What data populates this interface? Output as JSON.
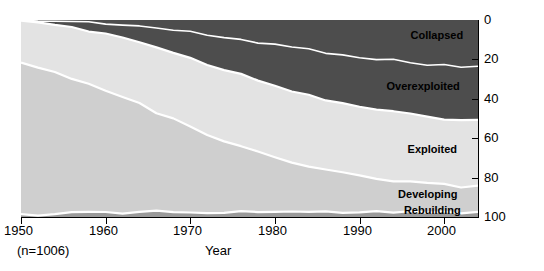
{
  "chart_data": {
    "type": "area",
    "stacked": true,
    "title": "",
    "xlabel": "Year",
    "ylabel": "Number of stocks by status (%)",
    "sample_note": "(n=1006)",
    "xlim": [
      1950,
      2004
    ],
    "ylim": [
      0,
      100
    ],
    "y_inverted": true,
    "xticks": [
      1950,
      1960,
      1970,
      1980,
      1990,
      2000
    ],
    "yticks": [
      0,
      20,
      40,
      60,
      80,
      100
    ],
    "grid": false,
    "legend_position": "inline-labels",
    "x": [
      1950,
      1952,
      1954,
      1956,
      1958,
      1960,
      1962,
      1964,
      1966,
      1968,
      1970,
      1972,
      1974,
      1976,
      1978,
      1980,
      1982,
      1984,
      1986,
      1988,
      1990,
      1992,
      1994,
      1996,
      1998,
      2000,
      2002,
      2004
    ],
    "series": [
      {
        "name": "Collapsed",
        "color": "#4d4d4d",
        "values": [
          0.0,
          0.2,
          0.5,
          0.8,
          1.2,
          1.6,
          2.2,
          3.0,
          4.0,
          5.2,
          6.4,
          7.6,
          8.8,
          10.0,
          11.2,
          12.5,
          13.8,
          15.0,
          16.2,
          17.4,
          18.6,
          19.6,
          20.6,
          21.5,
          22.3,
          23.0,
          23.6,
          24.0
        ]
      },
      {
        "name": "Overexploited",
        "color": "#4d4d4d",
        "values": [
          1.0,
          1.6,
          2.2,
          3.0,
          4.0,
          5.2,
          6.6,
          8.2,
          9.8,
          11.4,
          13.0,
          14.6,
          16.2,
          17.8,
          19.2,
          20.6,
          21.8,
          23.0,
          24.0,
          24.8,
          25.4,
          25.9,
          26.3,
          26.6,
          26.9,
          27.0,
          27.1,
          27.2
        ]
      },
      {
        "name": "Exploited",
        "color": "#e3e3e3",
        "values": [
          21.0,
          22.5,
          24.0,
          25.5,
          27.0,
          28.5,
          30.0,
          31.5,
          33.0,
          34.0,
          35.0,
          35.8,
          36.4,
          36.8,
          37.0,
          37.0,
          36.8,
          36.5,
          36.2,
          35.8,
          35.4,
          35.0,
          34.6,
          34.3,
          34.0,
          33.8,
          33.6,
          33.5
        ]
      },
      {
        "name": "Developing",
        "color": "#cfcfcf",
        "values": [
          77.0,
          74.5,
          71.8,
          68.9,
          65.8,
          62.5,
          58.8,
          54.8,
          50.7,
          46.9,
          43.2,
          39.7,
          36.3,
          33.1,
          30.2,
          27.5,
          25.2,
          23.0,
          21.0,
          19.3,
          17.8,
          16.6,
          15.6,
          14.8,
          14.1,
          13.5,
          13.1,
          12.8
        ]
      },
      {
        "name": "Rebuilding",
        "color": "#9a9a9a",
        "values": [
          1.0,
          1.2,
          1.5,
          1.8,
          2.0,
          2.2,
          2.4,
          2.5,
          2.5,
          2.5,
          2.4,
          2.3,
          2.3,
          2.3,
          2.4,
          2.4,
          2.4,
          2.5,
          2.6,
          2.7,
          2.8,
          2.9,
          2.9,
          2.8,
          2.7,
          2.7,
          2.6,
          2.5
        ]
      }
    ],
    "band_labels": [
      {
        "name": "Collapsed",
        "x_pct": 91,
        "y_pct": 8
      },
      {
        "name": "Overexploited",
        "x_pct": 88,
        "y_pct": 34
      },
      {
        "name": "Exploited",
        "x_pct": 90,
        "y_pct": 66
      },
      {
        "name": "Developing",
        "x_pct": 89,
        "y_pct": 89
      },
      {
        "name": "Rebuilding",
        "x_pct": 90,
        "y_pct": 97
      }
    ]
  },
  "axis": {
    "xticklabels": [
      "1950",
      "1960",
      "1970",
      "1980",
      "1990",
      "2000"
    ],
    "yticklabels": [
      "0",
      "20",
      "40",
      "60",
      "80",
      "100"
    ],
    "xtitle": "Year",
    "ytitle": "Number of stocks by status (%)",
    "note": "(n=1006)"
  },
  "colors": {
    "collapsed": "#4d4d4d",
    "overexploited": "#4d4d4d",
    "exploited": "#e3e3e3",
    "developing": "#cfcfcf",
    "rebuilding": "#9a9a9a",
    "separator": "#ffffff",
    "axis": "#000000",
    "background": "#ffffff"
  }
}
